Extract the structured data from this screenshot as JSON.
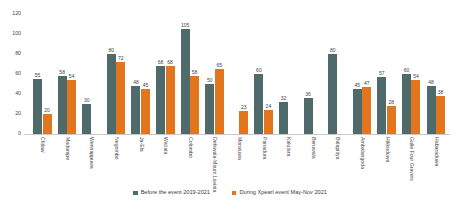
{
  "chart_data": {
    "type": "bar",
    "title": "",
    "xlabel": "",
    "ylabel": "",
    "ylim": [
      0,
      120
    ],
    "yticks": [
      "120",
      "100",
      "80",
      "60",
      "40",
      "20",
      "0"
    ],
    "grid": false,
    "legend_position": "bottom-center",
    "colors": {
      "before": "#4e6a6b",
      "during": "#e2761f",
      "axis": "#c9c9c9",
      "text": "#3b3b3b",
      "background": "#ffffff"
    },
    "categories": [
      "Chilaw",
      "Madampe",
      "Wennappuwa",
      "Negombo",
      "Ja-Ela",
      "Wattala",
      "Colombo",
      "Dehiwala-Mount Lavinia",
      "Moratuwa",
      "Panadura",
      "Kalutara",
      "Beruwala",
      "Balapitiya",
      "Ambalangoda",
      "Hikkaduwa",
      "Galle Four Gravets",
      "Habaraduwa"
    ],
    "series": [
      {
        "name": "Before the event 2019-2021",
        "color": "#4e6a6b",
        "values": [
          55,
          58,
          30,
          80,
          48,
          68,
          105,
          50,
          null,
          60,
          32,
          36,
          80,
          45,
          57,
          60,
          48
        ]
      },
      {
        "name": "During Xpearl event May-Nov 2021",
        "color": "#e2761f",
        "values": [
          20,
          54,
          null,
          72,
          45,
          68,
          58,
          65,
          23,
          24,
          null,
          null,
          null,
          47,
          28,
          54,
          38
        ]
      }
    ]
  },
  "legend": {
    "items": [
      {
        "label": "Before the event 2019-2021",
        "key": "before"
      },
      {
        "label": "During Xpearl event May-Nov 2021",
        "key": "during"
      }
    ]
  }
}
